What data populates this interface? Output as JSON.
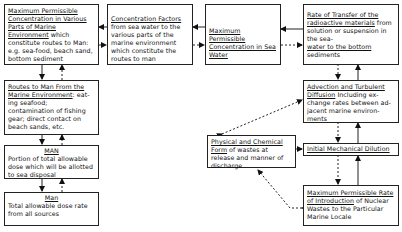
{
  "diagram": {
    "nodes": {
      "max_conc_marine_parts": {
        "title": "Maximum Permissible Concentration in Various Parts of Marine Environment",
        "body": " which constitute routes to Man: e.g. sea-food, beach sand, bottom sediment"
      },
      "concentration_factors": {
        "title": "Concentration Factors",
        "body": "from sea water to the various parts of the marine environment which constitute the routes to man"
      },
      "max_conc_sea_water": {
        "title": "Maximum Permissible Concentration in Sea Water",
        "body": ""
      },
      "rate_of_transfer": {
        "title": "Rate of Transfer of the radioactive materials",
        "body_mid": " from solution or suspension in the sea-",
        "title2": "water to the bottom",
        "body": " sediments"
      },
      "routes_to_man": {
        "title": "Routes to Man From the Marine Environment",
        "body": ": eat-ing seafood; contamination of fishing gear; direct contact on beach sands, etc."
      },
      "man_portion": {
        "title": "MAN",
        "body": "Portion of total allowable dose which will be allotted to sea disposal"
      },
      "man_total": {
        "title": "Man",
        "body": "Total allowable dose rate from all sources"
      },
      "advection_diffusion": {
        "title": "Advection and Turbulent Diffusion",
        "body": " Including ex-change rates between ad-jacent marine environ-ments"
      },
      "physical_chemical_form": {
        "title": "Physical and Chemical Form",
        "body": " of wastes at release and manner of discharge"
      },
      "initial_dilution": {
        "title": "Initial Mechanical Dilution",
        "body": ""
      },
      "max_rate_introduction": {
        "title": "Maximum Permissible Rate of Introduction",
        "body": " of Nuclear Wastes to the Particular Marine Locale"
      }
    },
    "edges": [
      {
        "from": "concentration_factors",
        "to": "max_conc_marine_parts",
        "style": "solid"
      },
      {
        "from": "max_conc_marine_parts",
        "to": "concentration_factors",
        "style": "dashed"
      },
      {
        "from": "max_conc_sea_water",
        "to": "concentration_factors",
        "style": "solid"
      },
      {
        "from": "concentration_factors",
        "to": "max_conc_sea_water",
        "style": "dashed"
      },
      {
        "from": "rate_of_transfer",
        "to": "max_conc_sea_water",
        "style": "solid"
      },
      {
        "from": "max_conc_sea_water",
        "to": "rate_of_transfer",
        "style": "dashed"
      },
      {
        "from": "max_conc_marine_parts",
        "to": "routes_to_man",
        "style": "solid"
      },
      {
        "from": "routes_to_man",
        "to": "max_conc_marine_parts",
        "style": "dashed"
      },
      {
        "from": "routes_to_man",
        "to": "man_portion",
        "style": "solid"
      },
      {
        "from": "man_portion",
        "to": "routes_to_man",
        "style": "dashed"
      },
      {
        "from": "man_portion",
        "to": "man_total",
        "style": "solid"
      },
      {
        "from": "man_total",
        "to": "man_portion",
        "style": "dashed"
      },
      {
        "from": "rate_of_transfer",
        "to": "advection_diffusion",
        "style": "dashed"
      },
      {
        "from": "advection_diffusion",
        "to": "rate_of_transfer",
        "style": "solid"
      },
      {
        "from": "advection_diffusion",
        "to": "initial_dilution",
        "style": "dashed"
      },
      {
        "from": "initial_dilution",
        "to": "advection_diffusion",
        "style": "solid"
      },
      {
        "from": "physical_chemical_form",
        "to": "advection_diffusion",
        "style": "dashed"
      },
      {
        "from": "physical_chemical_form",
        "to": "initial_dilution",
        "style": "dashed"
      },
      {
        "from": "initial_dilution",
        "to": "max_rate_introduction",
        "style": "dashed"
      },
      {
        "from": "max_rate_introduction",
        "to": "initial_dilution",
        "style": "solid"
      },
      {
        "from": "max_rate_introduction",
        "to": "physical_chemical_form",
        "style": "dashed"
      }
    ]
  }
}
